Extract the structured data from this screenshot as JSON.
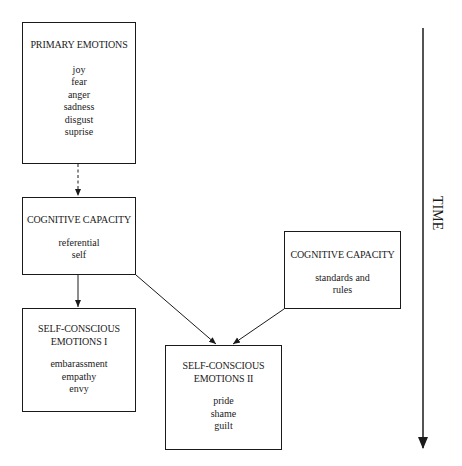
{
  "diagram": {
    "type": "flow",
    "nodes": [
      {
        "id": "primary",
        "title": "PRIMARY EMOTIONS",
        "items": [
          "joy",
          "fear",
          "anger",
          "sadness",
          "disgust",
          "suprise"
        ]
      },
      {
        "id": "cog1",
        "title": "COGNITIVE CAPACITY",
        "items": [
          "referential",
          "self"
        ]
      },
      {
        "id": "sc1",
        "title_lines": [
          "SELF-CONSCIOUS",
          "EMOTIONS I"
        ],
        "items": [
          "embarassment",
          "empathy",
          "envy"
        ]
      },
      {
        "id": "sc2",
        "title_lines": [
          "SELF-CONSCIOUS",
          "EMOTIONS II"
        ],
        "items": [
          "pride",
          "shame",
          "guilt"
        ]
      },
      {
        "id": "cog2",
        "title": "COGNITIVE CAPACITY",
        "items": [
          "standards and",
          "rules"
        ]
      }
    ],
    "edges": [
      {
        "from": "primary",
        "to": "cog1",
        "style": "dashed"
      },
      {
        "from": "cog1",
        "to": "sc1",
        "style": "solid"
      },
      {
        "from": "cog1",
        "to": "sc2",
        "style": "solid"
      },
      {
        "from": "cog2",
        "to": "sc2",
        "style": "solid"
      }
    ],
    "axis": {
      "label": "TIME",
      "direction": "down"
    }
  },
  "colors": {
    "stroke": "#1a1a1a",
    "background": "#ffffff"
  }
}
